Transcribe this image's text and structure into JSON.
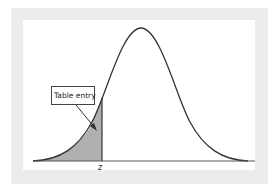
{
  "figure": {
    "type": "normal-distribution-diagram",
    "callout_label": "Table entry",
    "tick_label": "z",
    "colors": {
      "frame": "#ececec",
      "panel": "#ffffff",
      "curve": "#333333",
      "shaded_area": "#b0b0b0",
      "axis": "#555555"
    },
    "shaded_region": "left tail up to z"
  }
}
